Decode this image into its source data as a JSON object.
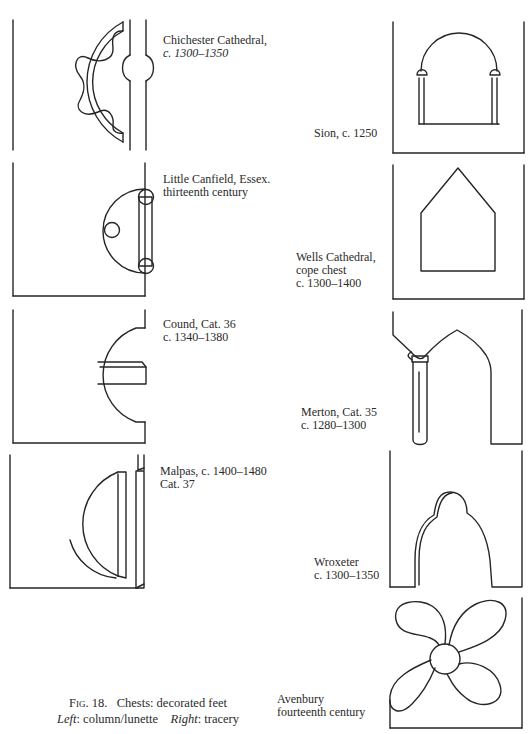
{
  "figure": {
    "number_label": "Fig. 18.",
    "title": "Chests: decorated feet",
    "legend_left_label": "Left",
    "legend_left_value": ": column/lunette",
    "legend_right_label": "Right",
    "legend_right_value": ": tracery"
  },
  "left_column": {
    "heading": "column/lunette",
    "items": [
      {
        "name": "chichester",
        "line1": "Chichester Cathedral,",
        "line2": "c. 1300–1350"
      },
      {
        "name": "little-canfield",
        "line1": "Little Canfield, Essex.",
        "line2": "thirteenth century"
      },
      {
        "name": "cound",
        "line1": "Cound, Cat. 36",
        "line2": "c. 1340–1380"
      },
      {
        "name": "malpas",
        "line1": "Malpas, c. 1400–1480",
        "line2": "Cat. 37"
      }
    ]
  },
  "right_column": {
    "heading": "tracery",
    "items": [
      {
        "name": "sion",
        "line1": "Sion, c. 1250"
      },
      {
        "name": "wells",
        "line1": "Wells Cathedral,",
        "line2": "cope chest",
        "line3": "c. 1300–1400"
      },
      {
        "name": "merton",
        "line1": "Merton, Cat. 35",
        "line2": "c. 1280–1300"
      },
      {
        "name": "wroxeter",
        "line1": "Wroxeter",
        "line2": "c. 1300–1350"
      },
      {
        "name": "avenbury",
        "line1": "Avenbury",
        "line2": "fourteenth century"
      }
    ]
  }
}
